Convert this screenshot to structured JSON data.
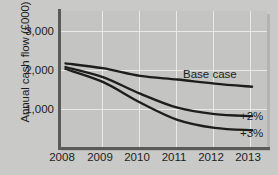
{
  "chart_data": {
    "type": "line",
    "title": "",
    "xlabel": "",
    "ylabel": "Annual cash flow (£000)",
    "x": [
      2008,
      2009,
      2010,
      2011,
      2012,
      2013
    ],
    "xticklabels": [
      "2008",
      "2009",
      "2010",
      "2011",
      "2012",
      "2013"
    ],
    "yticklabels": [
      "3,000",
      "2,000",
      "1,000"
    ],
    "yticks": [
      3000,
      2000,
      1000
    ],
    "ylim": [
      0,
      3400
    ],
    "xlim": [
      2007.8,
      2013.4
    ],
    "grid": true,
    "legend_position": "inline-right",
    "series": [
      {
        "name": "Base case",
        "label": "Base case",
        "color": "#1d1d1d",
        "values": [
          2100,
          1980,
          1790,
          1700,
          1600,
          1520
        ]
      },
      {
        "name": "+2%",
        "label": "+2%",
        "color": "#1d1d1d",
        "values": [
          2010,
          1760,
          1350,
          1000,
          840,
          790
        ]
      },
      {
        "name": "+3%",
        "label": "+3%",
        "color": "#1d1d1d",
        "values": [
          1960,
          1640,
          1130,
          700,
          500,
          440
        ]
      }
    ],
    "annotations": [
      {
        "text": "Base case",
        "x": 2011.6,
        "y": 1880
      },
      {
        "text": "+2%",
        "x": 2013.5,
        "y": 800
      },
      {
        "text": "+3%",
        "x": 2013.5,
        "y": 450
      }
    ],
    "colors": {
      "background": "#c9c9c7",
      "plot_background": "#c4c4c2",
      "gridline": "#e9e9e7",
      "axis": "#5a5a58",
      "line": "#1d1d1d",
      "text": "#1d1d1d"
    }
  }
}
